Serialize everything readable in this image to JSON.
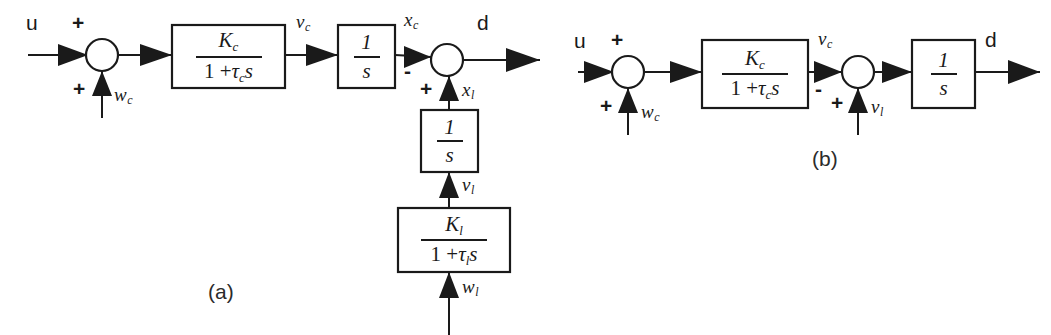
{
  "figure": {
    "type": "block-diagram",
    "background_color": "#ffffff",
    "line_color": "#1a1a1a"
  },
  "panels": [
    {
      "id": "a",
      "caption": "(a)",
      "signals": {
        "input": "u",
        "output": "d",
        "carriage_disturbance": "w",
        "carriage_disturbance_sub": "c",
        "carriage_velocity": "v",
        "carriage_velocity_sub": "c",
        "carriage_position": "x",
        "carriage_position_sub": "c",
        "load_position": "x",
        "load_position_sub": "l",
        "load_velocity": "v",
        "load_velocity_sub": "l",
        "load_disturbance": "w",
        "load_disturbance_sub": "l"
      },
      "signs": {
        "sum1_top": "+",
        "sum1_bottom": "+",
        "sum2_left": "-",
        "sum2_bottom": "+"
      },
      "blocks": [
        {
          "name": "carriage-lag-block",
          "numerator": "K",
          "numerator_sub": "c",
          "denominator_prefix": "1 +",
          "denominator_tau": "τ",
          "denominator_tau_sub": "c",
          "denominator_suffix": "s"
        },
        {
          "name": "carriage-integrator-block",
          "numerator": "1",
          "denominator": "s"
        },
        {
          "name": "load-integrator-block",
          "numerator": "1",
          "denominator": "s"
        },
        {
          "name": "load-lag-block",
          "numerator": "K",
          "numerator_sub": "l",
          "denominator_prefix": "1 +",
          "denominator_tau": "τ",
          "denominator_tau_sub": "l",
          "denominator_suffix": "s"
        }
      ]
    },
    {
      "id": "b",
      "caption": "(b)",
      "signals": {
        "input": "u",
        "output": "d",
        "carriage_disturbance": "w",
        "carriage_disturbance_sub": "c",
        "carriage_velocity": "v",
        "carriage_velocity_sub": "c",
        "load_velocity": "v",
        "load_velocity_sub": "l"
      },
      "signs": {
        "sum1_top": "+",
        "sum1_bottom": "+",
        "sum2_left": "-",
        "sum2_bottom": "+"
      },
      "blocks": [
        {
          "name": "carriage-lag-block",
          "numerator": "K",
          "numerator_sub": "c",
          "denominator_prefix": "1 +",
          "denominator_tau": "τ",
          "denominator_tau_sub": "c",
          "denominator_suffix": "s"
        },
        {
          "name": "integrator-block",
          "numerator": "1",
          "denominator": "s"
        }
      ]
    }
  ]
}
